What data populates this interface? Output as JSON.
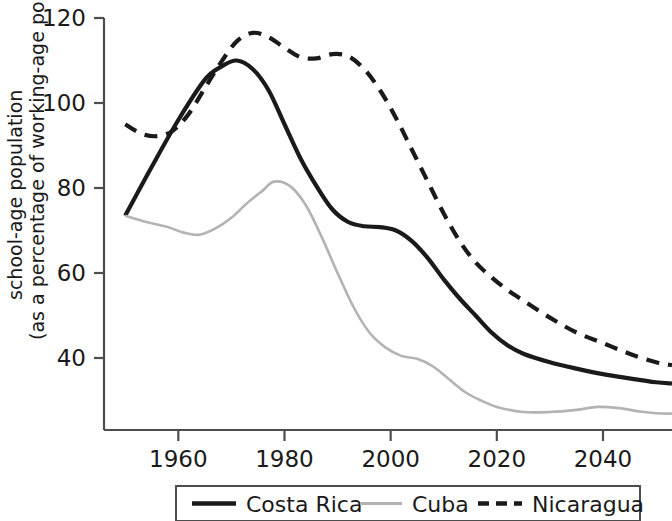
{
  "chart_data": {
    "type": "line",
    "title": "",
    "xlabel": "",
    "ylabel": "school-age population (as a percentage of working-age population)",
    "ylabel_line1": "school-age population",
    "ylabel_line2": "(as a percentage of working-age population)",
    "xlim": [
      1946,
      2053
    ],
    "ylim": [
      23,
      123
    ],
    "grid": false,
    "legend_position": "bottom",
    "x_ticks": [
      1960,
      1980,
      2000,
      2020,
      2040
    ],
    "x_tick_labels": [
      "1960",
      "1980",
      "2000",
      "2020",
      "2040"
    ],
    "y_ticks": [
      40,
      60,
      80,
      100,
      120
    ],
    "y_tick_labels": [
      "40",
      "60",
      "80",
      "100",
      "120"
    ],
    "series": [
      {
        "name": "Costa Rica",
        "style": "solid",
        "color": "#1a1a1a",
        "width": 4.2,
        "x": [
          1950,
          1955,
          1960,
          1965,
          1968,
          1971,
          1974,
          1977,
          1980,
          1983,
          1986,
          1989,
          1992,
          1995,
          1998,
          2001,
          2004,
          2007,
          2010,
          2013,
          2016,
          2019,
          2022,
          2025,
          2030,
          2035,
          2040,
          2045,
          2050,
          2053
        ],
        "y": [
          73.5,
          85.0,
          96.0,
          105.5,
          108.5,
          110.0,
          108.0,
          103.0,
          95.0,
          87.0,
          80.5,
          75.0,
          72.0,
          71.0,
          70.8,
          70.0,
          67.5,
          63.5,
          58.5,
          54.0,
          50.0,
          46.0,
          43.0,
          41.0,
          39.0,
          37.5,
          36.2,
          35.2,
          34.3,
          34.0
        ]
      },
      {
        "name": "Cuba",
        "style": "solid",
        "color": "#b3b3b3",
        "width": 2.6,
        "x": [
          1950,
          1954,
          1958,
          1961,
          1964,
          1967,
          1970,
          1973,
          1976,
          1978,
          1981,
          1984,
          1987,
          1990,
          1993,
          1996,
          1999,
          2002,
          2005,
          2008,
          2011,
          2014,
          2017,
          2020,
          2025,
          2030,
          2035,
          2039,
          2043,
          2047,
          2050,
          2053
        ],
        "y": [
          73.5,
          72.0,
          70.8,
          69.5,
          69.0,
          70.5,
          73.0,
          76.5,
          79.5,
          81.5,
          80.5,
          76.0,
          68.5,
          60.0,
          52.0,
          46.0,
          42.5,
          40.5,
          39.8,
          38.0,
          35.0,
          32.0,
          30.0,
          28.5,
          27.3,
          27.3,
          27.8,
          28.5,
          28.2,
          27.4,
          27.0,
          26.9
        ]
      },
      {
        "name": "Nicaragua",
        "style": "dashed",
        "color": "#1a1a1a",
        "width": 4.2,
        "x": [
          1950,
          1953,
          1956,
          1959,
          1962,
          1965,
          1968,
          1971,
          1974,
          1977,
          1980,
          1983,
          1986,
          1989,
          1992,
          1995,
          1998,
          2001,
          2004,
          2007,
          2010,
          2013,
          2016,
          2019,
          2022,
          2025,
          2030,
          2035,
          2040,
          2045,
          2050,
          2053
        ],
        "y": [
          95.0,
          92.8,
          92.2,
          93.5,
          97.5,
          103.5,
          109.5,
          114.5,
          116.5,
          115.5,
          113.0,
          110.8,
          110.5,
          111.5,
          111.0,
          108.0,
          103.0,
          96.5,
          89.0,
          81.5,
          74.0,
          67.5,
          62.5,
          59.0,
          56.0,
          53.5,
          49.5,
          46.0,
          43.5,
          41.0,
          39.0,
          38.3
        ]
      }
    ]
  },
  "legend": {
    "items": [
      {
        "label": "Costa Rica",
        "marker": "solid-line-black"
      },
      {
        "label": "Cuba",
        "marker": "solid-line-gray"
      },
      {
        "label": "Nicaragua",
        "marker": "dashed-line-black"
      }
    ]
  },
  "colors": {
    "costa_rica": "#1a1a1a",
    "cuba": "#b3b3b3",
    "nicaragua": "#1a1a1a",
    "axis": "#4d4d4d",
    "background": "#ffffff"
  }
}
